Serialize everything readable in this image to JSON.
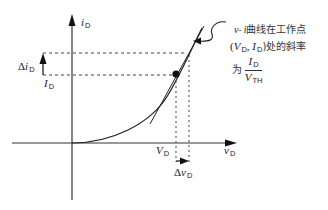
{
  "diagram": {
    "axes": {
      "y_label": "i",
      "y_label_sub": "D",
      "x_label": "v",
      "x_label_sub": "D"
    },
    "markers": {
      "delta_i_prefix": "Δ",
      "delta_i_var": "i",
      "delta_i_sub": "D",
      "I_var": "I",
      "I_sub": "D",
      "V_var": "V",
      "V_sub": "D",
      "delta_v_prefix": "Δ",
      "delta_v_var": "v",
      "delta_v_sub": "D"
    },
    "annotation": {
      "line1_var1": "v",
      "line1_sep": "- ",
      "line1_var2": "i",
      "line1_text": "曲线在工作点",
      "line2_open": "(",
      "line2_V": "V",
      "line2_V_sub": "D",
      "line2_comma": ", ",
      "line2_I": "I",
      "line2_I_sub": "D",
      "line2_text": ")处的斜率",
      "line3_prefix": "为",
      "frac_num_var": "I",
      "frac_num_sub": "D",
      "frac_den_var": "V",
      "frac_den_sub": "TH"
    },
    "colors": {
      "line": "#222222",
      "dash": "#444444",
      "background": "#ffffff"
    }
  }
}
